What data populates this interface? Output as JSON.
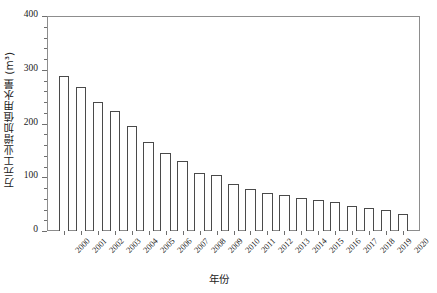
{
  "chart_data": {
    "type": "bar",
    "title": "",
    "xlabel": "年份",
    "ylabel": "万元工业增加值用水量 (m³)",
    "categories": [
      "2000",
      "2001",
      "2002",
      "2003",
      "2004",
      "2005",
      "2006",
      "2007",
      "2008",
      "2009",
      "2010",
      "2011",
      "2012",
      "2013",
      "2014",
      "2015",
      "2016",
      "2017",
      "2018",
      "2019",
      "2020"
    ],
    "values": [
      288,
      268,
      240,
      223,
      196,
      165,
      145,
      131,
      108,
      105,
      88,
      78,
      70,
      67,
      62,
      57,
      54,
      46,
      43,
      39,
      32
    ],
    "ylim": [
      0,
      400
    ],
    "yticks": [
      0,
      100,
      200,
      300,
      400
    ],
    "ytick_labels": [
      "0",
      "100",
      "200",
      "300",
      "400"
    ],
    "yminor_step": 20,
    "grid": false,
    "legend": null,
    "bar_facecolor": "#ffffff",
    "bar_edgecolor": "#4a4a4a",
    "axis_color": "#8d8d8d",
    "background": "#ffffff"
  }
}
